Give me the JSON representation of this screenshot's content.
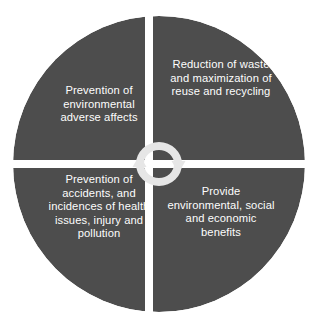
{
  "diagram": {
    "type": "four-quadrant-circle",
    "title": "",
    "center_icon": "recycle-arrows-icon",
    "colors": {
      "quadrant_fill": "#4d4d4d",
      "divider": "#ffffff",
      "text": "#fdfdfd",
      "background": "#ffffff",
      "icon": "#e8e8e8"
    },
    "quadrants": [
      {
        "position": "top-left",
        "text": "Prevention of environmental adverse affects",
        "lines": [
          "Prevention of",
          "environmental",
          "adverse affects"
        ]
      },
      {
        "position": "top-right",
        "text": "Reduction of waste and maximization of reuse and recycling",
        "lines": [
          "Reduction of",
          "waste and",
          "maximization of",
          "reuse and",
          "recycling"
        ]
      },
      {
        "position": "bottom-left",
        "text": "Prevention of accidents, and incidences of health issues, injury and pollution",
        "lines": [
          "Prevention of",
          "accidents, and",
          "incidences of",
          "health issues,",
          "injury and",
          "pollution"
        ]
      },
      {
        "position": "bottom-right",
        "text": "Provide environmental, social and economic benefits",
        "lines": [
          "Provide",
          "environmental,",
          "social and",
          "economic",
          "benefits"
        ]
      }
    ]
  }
}
